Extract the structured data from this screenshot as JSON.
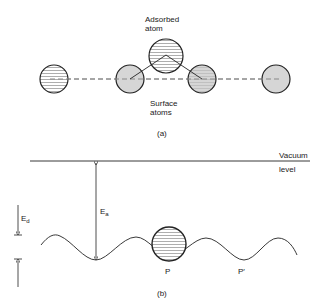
{
  "panel_a": {
    "adsorbed_label_line1": "Adsorbed",
    "adsorbed_label_line2": "atom",
    "surface_label_line1": "Surface",
    "surface_label_line2": "atoms",
    "caption": "(a)"
  },
  "panel_b": {
    "vacuum_label_line1": "Vacuum",
    "vacuum_label_line2": "level",
    "ea_label": "E",
    "ea_sub": "a",
    "ed_label": "E",
    "ed_sub": "d",
    "p_label": "P",
    "p_prime_label": "P′",
    "caption": "(b)"
  },
  "colors": {
    "stroke": "#222222",
    "shaded_fill": "#d4d4d4",
    "hatch": "#555555",
    "dash": "#888888"
  }
}
